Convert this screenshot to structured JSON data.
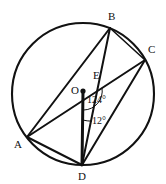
{
  "figure": {
    "kind": "circle-geometry-diagram",
    "background_color": "#ffffff",
    "stroke_color": "#111111",
    "width": 166,
    "height": 184
  },
  "circle": {
    "label": "circle-O",
    "center_x": 83,
    "center_y": 94,
    "radius": 71
  },
  "points": [
    {
      "id": "A",
      "label": "A",
      "x": 27,
      "y": 137,
      "label_x": 14,
      "label_y": 148,
      "on_circle": true,
      "dot": false
    },
    {
      "id": "B",
      "label": "B",
      "x": 110,
      "y": 28,
      "label_x": 108,
      "label_y": 20,
      "on_circle": true,
      "dot": false
    },
    {
      "id": "C",
      "label": "C",
      "x": 145,
      "y": 60,
      "label_x": 148,
      "label_y": 53,
      "on_circle": true,
      "dot": false
    },
    {
      "id": "D",
      "label": "D",
      "x": 82,
      "y": 165,
      "label_x": 78,
      "label_y": 180,
      "on_circle": true,
      "dot": false
    },
    {
      "id": "O",
      "label": "O",
      "x": 83,
      "y": 91,
      "label_x": 71,
      "label_y": 94,
      "on_circle": false,
      "dot": true
    },
    {
      "id": "E",
      "label": "E",
      "x": 97,
      "y": 86,
      "label_x": 93,
      "label_y": 79,
      "on_circle": false,
      "dot": false
    }
  ],
  "segments": [
    {
      "id": "A-B",
      "from": "A",
      "to": "B",
      "weight": "normal"
    },
    {
      "id": "B-D",
      "from": "B",
      "to": "D",
      "weight": "normal"
    },
    {
      "id": "B-C",
      "from": "B",
      "to": "C",
      "weight": "normal"
    },
    {
      "id": "C-D",
      "from": "C",
      "to": "D",
      "weight": "normal"
    },
    {
      "id": "A-C",
      "from": "A",
      "to": "C",
      "weight": "normal"
    },
    {
      "id": "A-D",
      "from": "A",
      "to": "D",
      "weight": "normal"
    },
    {
      "id": "O-D",
      "from": "O",
      "to": "D",
      "weight": "thick"
    }
  ],
  "angles": [
    {
      "id": "angle-at-O",
      "label": "124°",
      "vertex": "O",
      "value": 124,
      "unit": "degrees",
      "label_x": 87,
      "label_y": 103,
      "arc_radius": 19
    },
    {
      "id": "angle-at-D",
      "label": "12°",
      "vertex": "D",
      "value": 12,
      "unit": "degrees",
      "label_x": 92,
      "label_y": 124,
      "arc_radius": 45
    }
  ]
}
